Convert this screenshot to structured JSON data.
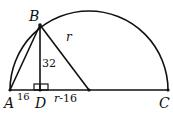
{
  "diagram": {
    "type": "geometry-semicircle",
    "points": {
      "A": {
        "label": "A",
        "x": 10,
        "y": 90
      },
      "B": {
        "label": "B",
        "x": 40,
        "y": 25
      },
      "C": {
        "label": "C",
        "x": 170,
        "y": 90
      },
      "D": {
        "label": "D",
        "x": 40,
        "y": 90
      },
      "O": {
        "x": 89,
        "y": 90
      }
    },
    "radius": 79,
    "labels": {
      "A": "A",
      "B": "B",
      "C": "C",
      "D": "D",
      "radius": "r",
      "height": "32",
      "AD": "16",
      "DO": "r-16"
    },
    "stroke_color": "#111111",
    "background": "#ffffff"
  }
}
